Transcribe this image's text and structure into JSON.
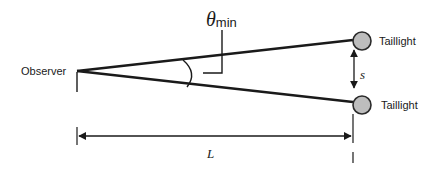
{
  "diagram": {
    "labels": {
      "observer": "Observer",
      "theta_symbol": "θ",
      "theta_subscript": "min",
      "separation": "s",
      "distance": "L",
      "taillight_top": "Taillight",
      "taillight_bottom": "Taillight"
    },
    "colors": {
      "line": "#1a1a1a",
      "taillight_fill": "#bdbdbd",
      "taillight_stroke": "#2a2a2a",
      "background": "#ffffff"
    },
    "geometry": {
      "observer_point": [
        77,
        71
      ],
      "taillight_top_center": [
        362,
        41
      ],
      "taillight_bottom_center": [
        362,
        105
      ],
      "taillight_radius": 9,
      "distance_arrow_y": 136
    }
  }
}
